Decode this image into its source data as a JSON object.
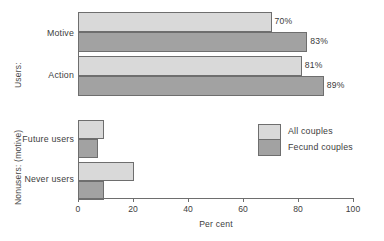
{
  "chart_data": {
    "type": "bar",
    "orientation": "horizontal",
    "title": "",
    "xlabel": "Per cent",
    "ylabel": "",
    "xlim": [
      0,
      100
    ],
    "xticks": [
      0,
      20,
      40,
      60,
      80,
      100
    ],
    "grid": false,
    "legend_position": "center-right",
    "groups": [
      {
        "axis_label": "Users:",
        "categories": [
          "Motive",
          "Action"
        ],
        "series": [
          {
            "name": "All couples",
            "values": [
              70,
              81
            ],
            "labels": [
              "70%",
              "81%"
            ]
          },
          {
            "name": "Fecund couples",
            "values": [
              83,
              89
            ],
            "labels": [
              "83%",
              "89%"
            ]
          }
        ]
      },
      {
        "axis_label": "Nonusers: (motive)",
        "categories": [
          "Future users",
          "Never users"
        ],
        "series": [
          {
            "name": "All couples",
            "values": [
              9,
              20
            ],
            "labels": [
              "",
              ""
            ]
          },
          {
            "name": "Fecund couples",
            "values": [
              7,
              9
            ],
            "labels": [
              "",
              ""
            ]
          }
        ]
      }
    ],
    "series_colors": {
      "All couples": "#d9d9d9",
      "Fecund couples": "#a2a2a2"
    }
  },
  "axis": {
    "x_title": "Per cent",
    "tick_0": "0",
    "tick_20": "20",
    "tick_40": "40",
    "tick_60": "60",
    "tick_80": "80",
    "tick_100": "100"
  },
  "group_labels": {
    "users": "Users:",
    "nonusers": "Nonusers: (motive)"
  },
  "categories": {
    "motive": "Motive",
    "action": "Action",
    "future_users": "Future users",
    "never_users": "Never users"
  },
  "values": {
    "motive_all": "70%",
    "motive_fecund": "83%",
    "action_all": "81%",
    "action_fecund": "89%"
  },
  "legend": {
    "all_couples": "All couples",
    "fecund_couples": "Fecund couples"
  }
}
